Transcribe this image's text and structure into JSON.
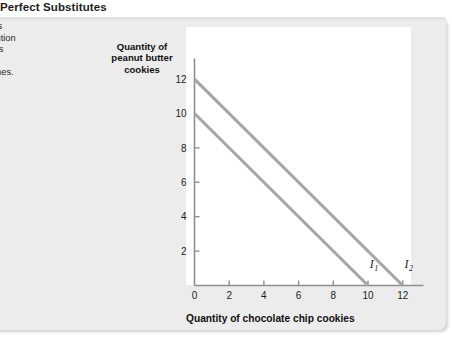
{
  "figure": {
    "title": "Perfect Substitutes",
    "caption_lines": [
      "ct substitutes",
      "te of substitution",
      " the quantities",
      "se, the",
      "re straight lines."
    ]
  },
  "chart_data": {
    "type": "line",
    "title": "Perfect Substitutes",
    "xlabel": "Quantity of chocolate chip cookies",
    "ylabel": "Quantity of peanut butter cookies",
    "xlim": [
      0,
      13.2
    ],
    "ylim": [
      0,
      13.2
    ],
    "xticks": [
      0,
      2,
      4,
      6,
      8,
      10,
      12
    ],
    "yticks": [
      2,
      4,
      6,
      8,
      10,
      12
    ],
    "grid": false,
    "legend": "none",
    "line_color": "#a6a6a6",
    "axis_color": "#8f8f8f",
    "plot_background": "#ffffff",
    "panel_background": "#ececec",
    "series": [
      {
        "name": "I1",
        "label": "I",
        "subscript": "1",
        "x": [
          0,
          10
        ],
        "y": [
          10,
          0
        ],
        "slope": -1,
        "x_intercept": 10,
        "y_intercept": 10,
        "label_x": 10.1,
        "label_y": 1.0
      },
      {
        "name": "I2",
        "label": "I",
        "subscript": "2",
        "x": [
          0,
          12
        ],
        "y": [
          12,
          0
        ],
        "slope": -1,
        "x_intercept": 12,
        "y_intercept": 12,
        "label_x": 12.1,
        "label_y": 1.0
      }
    ]
  }
}
